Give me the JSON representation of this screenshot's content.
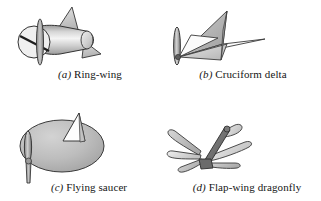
{
  "figure": {
    "background_color": "#ffffff",
    "ink_color": "#1a1a1a",
    "fill_light": "#e8e8e8",
    "fill_mid": "#b9b9b9",
    "fill_dark": "#8d8d8d",
    "fill_darkest": "#5e5e5e",
    "panels": [
      {
        "key": "a",
        "label": "(a)",
        "letter": "a",
        "name": "Ring-wing",
        "caption": "(a) Ring-wing",
        "icon": "ring-wing-diagram",
        "description": "Shaded cylindrical fuselage with an annular ring wing at the nose and two triangular tail fins"
      },
      {
        "key": "b",
        "label": "(b)",
        "letter": "b",
        "name": "Cruciform delta",
        "caption": "(b) Cruciform delta",
        "icon": "cruciform-delta-diagram",
        "description": "Four delta-shaped wing panels arranged in a cruciform about a nose propeller"
      },
      {
        "key": "c",
        "label": "(c)",
        "letter": "c",
        "name": "Flying saucer",
        "caption": "(c) Flying saucer",
        "icon": "flying-saucer-diagram",
        "description": "Large shaded disc body with an upright triangular fin and a nose propeller blade"
      },
      {
        "key": "d",
        "label": "(d)",
        "letter": "d",
        "name": "Flap-wing dragonfly",
        "caption": "(d) Flap-wing dragonfly",
        "icon": "flap-wing-dragonfly-diagram",
        "description": "Slender body with six paddle-shaped flapping wings radiating from a central hub"
      }
    ]
  }
}
